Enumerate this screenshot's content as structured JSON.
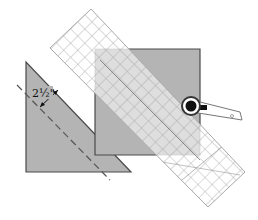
{
  "diagram": {
    "measurement_label": "2½\"",
    "colors": {
      "fabric": "#b4b4b4",
      "fabric_edge": "#4a4a4a",
      "ruler_grid": "#9a9a9a",
      "ruler_fill": "#ffffff",
      "dashed_line": "#555555",
      "cutter_body": "#ffffff",
      "cutter_wheel": "#111111"
    },
    "elements": [
      "triangle-fabric-piece",
      "dashed-seam-line",
      "measurement-arrow",
      "square-fabric",
      "quilting-ruler",
      "rotary-cutter"
    ]
  }
}
